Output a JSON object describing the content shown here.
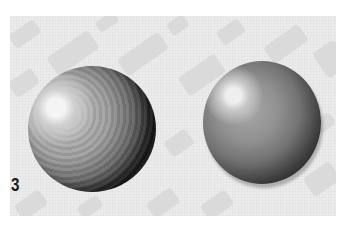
{
  "illustration": {
    "figure_number": "3",
    "background": {
      "color": "#ececec",
      "pattern": "diagonal light-gray dashes"
    },
    "spheres": [
      {
        "name": "textured-sphere",
        "style": "visible brushstrokes, strong shadow"
      },
      {
        "name": "smooth-sphere",
        "style": "smooth blended shading"
      }
    ]
  }
}
